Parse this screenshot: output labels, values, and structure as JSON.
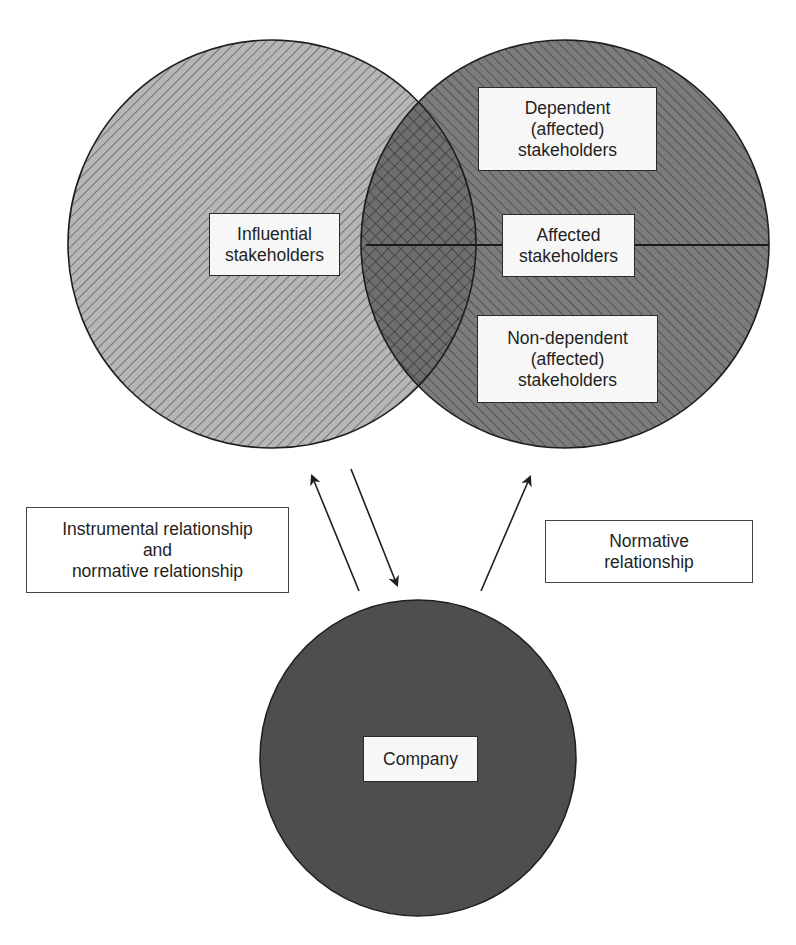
{
  "diagram": {
    "title": "",
    "colors": {
      "influential_fill": "#b4b4b4",
      "affected_fill": "#7a7a7a",
      "company_fill": "#4e4e4e",
      "outline": "#1e1e1e",
      "hatch_light": "#3a3a3a",
      "label_background": "#f7f7f7"
    },
    "nodes": {
      "influential": {
        "lines": [
          "Influential",
          "stakeholders"
        ]
      },
      "dependent": {
        "lines": [
          "Dependent",
          "(affected)",
          "stakeholders"
        ]
      },
      "affected": {
        "lines": [
          "Affected",
          "stakeholders"
        ]
      },
      "non_dependent": {
        "lines": [
          "Non-dependent",
          "(affected)",
          "stakeholders"
        ]
      },
      "company": {
        "lines": [
          "Company"
        ]
      }
    },
    "relationships": {
      "instrumental_and_normative": {
        "lines": [
          "Instrumental relationship",
          "and",
          "normative relationship"
        ]
      },
      "normative": {
        "lines": [
          "Normative",
          "relationship"
        ]
      }
    },
    "edges": [
      {
        "from": "company",
        "to": "influential",
        "label": "instrumental_and_normative"
      },
      {
        "from": "influential",
        "to": "company",
        "label": "instrumental_and_normative"
      },
      {
        "from": "company",
        "to": "affected",
        "label": "normative"
      }
    ]
  }
}
